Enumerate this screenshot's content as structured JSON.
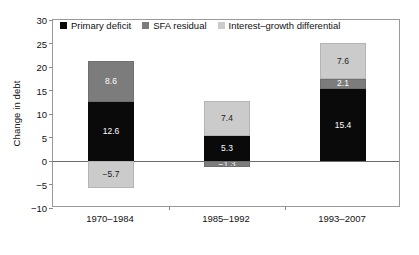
{
  "chart_data": {
    "type": "bar",
    "stacked": true,
    "title": "",
    "xlabel": "",
    "ylabel": "Change in debt",
    "ylim": [
      -10,
      30
    ],
    "yticks": [
      30,
      25,
      20,
      15,
      10,
      5,
      0,
      "−5",
      "−10"
    ],
    "ytick_values": [
      30,
      25,
      20,
      15,
      10,
      5,
      0,
      -5,
      -10
    ],
    "grid": false,
    "legend_position": "top-left-inside",
    "categories": [
      "1970–1984",
      "1985–1992",
      "1993–2007"
    ],
    "series": [
      {
        "name": "Primary deficit",
        "color": "#0a0a0a",
        "values": [
          12.6,
          5.3,
          15.4
        ],
        "labels": [
          "12.6",
          "5.3",
          "15.4"
        ]
      },
      {
        "name": "SFA residual",
        "color": "#7c7c7c",
        "values": [
          8.6,
          -1.3,
          2.1
        ],
        "labels": [
          "8.6",
          "−1.3",
          "2.1"
        ]
      },
      {
        "name": "Interest–growth differential",
        "color": "#cbcbcb",
        "values": [
          -5.7,
          7.4,
          7.6
        ],
        "labels": [
          "−5.7",
          "7.4",
          "7.6"
        ]
      }
    ],
    "bar_totals_positive": [
      21.2,
      12.7,
      25.1
    ],
    "bar_totals_negative": [
      -5.7,
      -1.3,
      0
    ]
  },
  "legend": {
    "items": [
      {
        "label": "Primary deficit",
        "swatch": "s-primary"
      },
      {
        "label": "SFA residual",
        "swatch": "s-sfa"
      },
      {
        "label": "Interest–growth differential",
        "swatch": "s-igd"
      }
    ]
  },
  "axis": {
    "y_label": "Change in debt",
    "y_ticks": [
      "30",
      "25",
      "20",
      "15",
      "10",
      "5",
      "0",
      "−5",
      "−10"
    ],
    "x_ticks": [
      "1970–1984",
      "1985–1992",
      "1993–2007"
    ]
  },
  "bars": [
    {
      "category": "1970–1984",
      "segments": [
        {
          "series": "SFA residual",
          "cls": "s-sfa",
          "label": "8.6",
          "value": 8.6,
          "y_top": 21.2,
          "y_bottom": 12.6
        },
        {
          "series": "Primary deficit",
          "cls": "s-primary",
          "label": "12.6",
          "value": 12.6,
          "y_top": 12.6,
          "y_bottom": 0
        },
        {
          "series": "Interest–growth differential",
          "cls": "s-igd",
          "label": "−5.7",
          "value": -5.7,
          "y_top": 0,
          "y_bottom": -5.7
        }
      ]
    },
    {
      "category": "1985–1992",
      "segments": [
        {
          "series": "Interest–growth differential",
          "cls": "s-igd",
          "label": "7.4",
          "value": 7.4,
          "y_top": 12.7,
          "y_bottom": 5.3
        },
        {
          "series": "Primary deficit",
          "cls": "s-primary",
          "label": "5.3",
          "value": 5.3,
          "y_top": 5.3,
          "y_bottom": 0
        },
        {
          "series": "SFA residual",
          "cls": "s-sfa",
          "label": "−1.3",
          "value": -1.3,
          "y_top": 0,
          "y_bottom": -1.3
        }
      ]
    },
    {
      "category": "1993–2007",
      "segments": [
        {
          "series": "Interest–growth differential",
          "cls": "s-igd",
          "label": "7.6",
          "value": 7.6,
          "y_top": 25.1,
          "y_bottom": 17.5
        },
        {
          "series": "SFA residual",
          "cls": "s-sfa",
          "label": "2.1",
          "value": 2.1,
          "y_top": 17.5,
          "y_bottom": 15.4
        },
        {
          "series": "Primary deficit",
          "cls": "s-primary",
          "label": "15.4",
          "value": 15.4,
          "y_top": 15.4,
          "y_bottom": 0
        }
      ]
    }
  ]
}
